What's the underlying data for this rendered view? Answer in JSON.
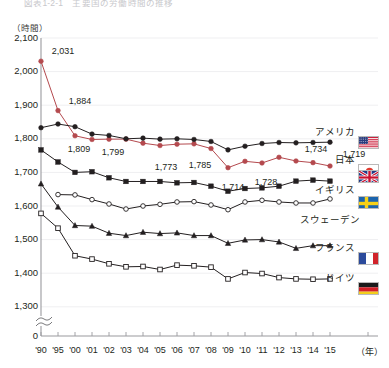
{
  "figure": {
    "title": "図表1-2-1　主要国の労働時間の推移",
    "unit_label": "（時間）",
    "x_unit_label": "（年）"
  },
  "axes": {
    "y_ticks": [
      "2,100",
      "2,000",
      "1,900",
      "1,800",
      "1,700",
      "1,600",
      "1,500",
      "1,400",
      "1,300",
      "0"
    ],
    "y_tick_values": [
      2100,
      2000,
      1900,
      1800,
      1700,
      1600,
      1500,
      1400,
      1300,
      0
    ],
    "y_axis_break": true,
    "x_ticks": [
      "'90",
      "'95",
      "'00",
      "'01",
      "'02",
      "'03",
      "'04",
      "'05",
      "'06",
      "'07",
      "'08",
      "'09",
      "'10",
      "'11",
      "'12",
      "'13",
      "'14",
      "'15"
    ]
  },
  "legend": {
    "items": [
      {
        "label": "アメリカ",
        "flag": "flag-us",
        "marker": "filled-circle",
        "color": "#231f20"
      },
      {
        "label": "日本",
        "flag": "flag-jp",
        "marker": "filled-circle",
        "color": "#b4494e"
      },
      {
        "label": "イギリス",
        "flag": "flag-uk",
        "marker": "filled-square",
        "color": "#231f20"
      },
      {
        "label": "スウェーデン",
        "flag": "flag-se",
        "marker": "open-circle",
        "color": "#231f20"
      },
      {
        "label": "フランス",
        "flag": "flag-fr",
        "marker": "filled-triangle",
        "color": "#231f20"
      },
      {
        "label": "ドイツ",
        "flag": "flag-de",
        "marker": "open-square",
        "color": "#231f20"
      }
    ]
  },
  "chart_data": {
    "type": "line",
    "title": "図表1-2-1　主要国の労働時間の推移",
    "xlabel": "（年）",
    "ylabel": "（時間）",
    "ylim": [
      1280,
      2100
    ],
    "grid": true,
    "legend_position": "right",
    "categories": [
      "'90",
      "'95",
      "'00",
      "'01",
      "'02",
      "'03",
      "'04",
      "'05",
      "'06",
      "'07",
      "'08",
      "'09",
      "'10",
      "'11",
      "'12",
      "'13",
      "'14",
      "'15"
    ],
    "series": [
      {
        "name": "日本",
        "color": "#b4494e",
        "marker": "filled-circle",
        "values": [
          2031,
          1884,
          1809,
          1798,
          1799,
          1799,
          1787,
          1780,
          1784,
          1785,
          1771,
          1714,
          1733,
          1728,
          1745,
          1734,
          1729,
          1719
        ],
        "labeled_points": [
          {
            "x": "'90",
            "value": 2031,
            "text": "2,031"
          },
          {
            "x": "'95",
            "value": 1884,
            "text": "1,884"
          },
          {
            "x": "'00",
            "value": 1809,
            "text": "1,809"
          },
          {
            "x": "'02",
            "value": 1799,
            "text": "1,799"
          },
          {
            "x": "'05",
            "value": 1780,
            "text": "1,773"
          },
          {
            "x": "'07",
            "value": 1785,
            "text": "1,785"
          },
          {
            "x": "'09",
            "value": 1714,
            "text": "1,714"
          },
          {
            "x": "'11",
            "value": 1728,
            "text": "1,728"
          },
          {
            "x": "'14",
            "value": 1734,
            "text": "1,734"
          },
          {
            "x": "'15",
            "value": 1719,
            "text": "1,719"
          }
        ]
      },
      {
        "name": "アメリカ",
        "color": "#231f20",
        "marker": "filled-circle",
        "values": [
          1833,
          1844,
          1836,
          1814,
          1810,
          1800,
          1802,
          1799,
          1800,
          1798,
          1792,
          1767,
          1778,
          1786,
          1789,
          1788,
          1789,
          1790
        ]
      },
      {
        "name": "イギリス",
        "color": "#231f20",
        "marker": "filled-square",
        "values": [
          1767,
          1731,
          1700,
          1702,
          1684,
          1673,
          1673,
          1673,
          1669,
          1670,
          1659,
          1644,
          1652,
          1654,
          1659,
          1674,
          1677,
          1674
        ]
      },
      {
        "name": "スウェーデン",
        "color": "#231f20",
        "marker": "open-circle",
        "values": [
          null,
          1634,
          1633,
          1619,
          1606,
          1591,
          1600,
          1605,
          1612,
          1613,
          1603,
          1589,
          1612,
          1617,
          1612,
          1609,
          1609,
          1621
        ]
      },
      {
        "name": "フランス",
        "color": "#231f20",
        "marker": "filled-triangle",
        "values": [
          1666,
          1597,
          1542,
          1540,
          1519,
          1512,
          1522,
          1518,
          1520,
          1512,
          1512,
          1489,
          1499,
          1500,
          1493,
          1474,
          1482,
          1482
        ]
      },
      {
        "name": "ドイツ",
        "color": "#231f20",
        "marker": "open-square",
        "values": [
          1578,
          1534,
          1452,
          1442,
          1428,
          1419,
          1420,
          1411,
          1424,
          1422,
          1418,
          1383,
          1402,
          1399,
          1387,
          1383,
          1382,
          1383
        ]
      }
    ]
  }
}
